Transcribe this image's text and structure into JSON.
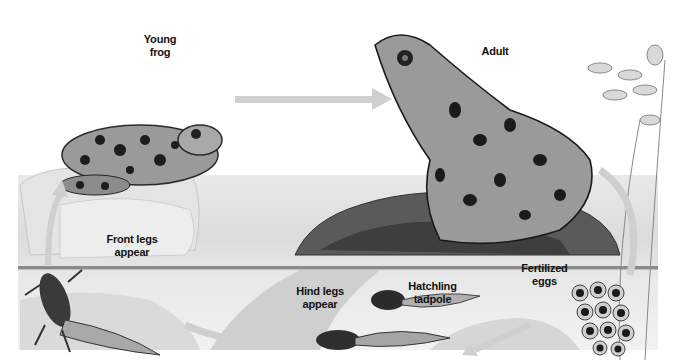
{
  "diagram": {
    "type": "life-cycle",
    "colors": {
      "background": "#ffffff",
      "arrow": "#cfcfcf",
      "water_line": "#8a8a8a",
      "ink": "#111111"
    },
    "stages": [
      {
        "id": "fertilized-eggs",
        "label_line1": "Fertilized",
        "label_line2": "eggs"
      },
      {
        "id": "hatchling-tadpole",
        "label_line1": "Hatchling",
        "label_line2": "tadpole"
      },
      {
        "id": "hind-legs",
        "label_line1": "Hind legs",
        "label_line2": "appear"
      },
      {
        "id": "front-legs",
        "label_line1": "Front legs",
        "label_line2": "appear"
      },
      {
        "id": "young-frog",
        "label_line1": "Young",
        "label_line2": "frog"
      },
      {
        "id": "adult",
        "label_line1": "Adult",
        "label_line2": ""
      }
    ],
    "arrows": [
      {
        "from": "fertilized-eggs",
        "to": "hatchling-tadpole"
      },
      {
        "from": "hatchling-tadpole",
        "to": "hind-legs"
      },
      {
        "from": "hind-legs",
        "to": "front-legs"
      },
      {
        "from": "front-legs",
        "to": "young-frog"
      },
      {
        "from": "young-frog",
        "to": "adult"
      },
      {
        "from": "adult",
        "to": "fertilized-eggs"
      }
    ]
  }
}
